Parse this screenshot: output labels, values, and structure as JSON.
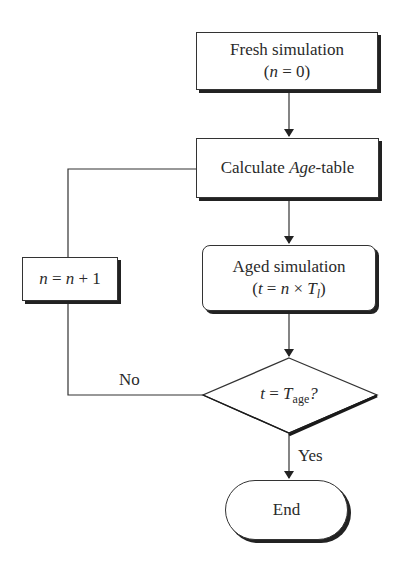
{
  "nodes": {
    "fresh": {
      "line1": "Fresh simulation",
      "line2_pre": "(",
      "line2_var": "n",
      "line2_post": " = 0)"
    },
    "calc": {
      "pre": "Calculate ",
      "italic": "Age",
      "post": "-table"
    },
    "increment": {
      "var1": "n",
      "mid": " = ",
      "var2": "n",
      "post": " + 1"
    },
    "aged": {
      "line1": "Aged simulation",
      "open": "(",
      "t": "t",
      "eq": " = ",
      "n": "n",
      "times": " × ",
      "T": "T",
      "sub": "l",
      "close": ")"
    },
    "decision": {
      "t": "t",
      "eq": " = ",
      "T": "T",
      "sub": "age",
      "q": "?"
    },
    "end": {
      "label": "End"
    }
  },
  "edges": {
    "no_label": "No",
    "yes_label": "Yes"
  },
  "colors": {
    "stroke": "#333333",
    "shadow": "#222222",
    "text": "#2a2a2a"
  }
}
